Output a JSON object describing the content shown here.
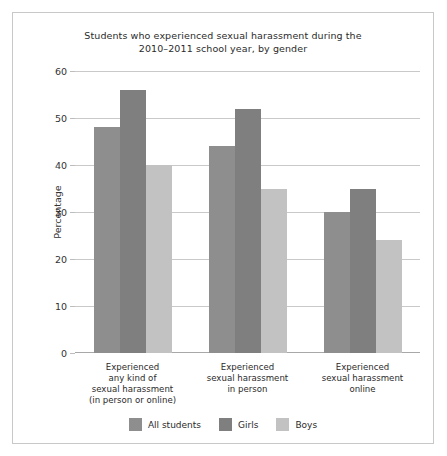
{
  "chart_data": {
    "type": "bar",
    "title": "Students who experienced sexual harassment during the\n2010–2011 school year, by gender",
    "title_line1": "Students who experienced sexual harassment during the",
    "title_line2": "2010–2011 school year, by gender",
    "xlabel": "",
    "ylabel": "Percentage",
    "ylim": [
      0,
      60
    ],
    "yticks": [
      0,
      10,
      20,
      30,
      40,
      50,
      60
    ],
    "ytick_labels": [
      "0",
      "10",
      "20",
      "30",
      "40",
      "50",
      "60"
    ],
    "grid": true,
    "legend_position": "bottom",
    "categories": [
      "Experienced\nany kind of\nsexual harassment\n(in person or online)",
      "Experienced\nsexual harassment\nin person",
      "Experienced\nsexual harassment\nonline"
    ],
    "series": [
      {
        "name": "All students",
        "color": "#8e8e8e",
        "values": [
          48,
          44,
          30
        ]
      },
      {
        "name": "Girls",
        "color": "#7f7f7f",
        "values": [
          56,
          52,
          35
        ]
      },
      {
        "name": "Boys",
        "color": "#c2c2c2",
        "values": [
          40,
          35,
          24
        ]
      }
    ]
  },
  "colors": {
    "frame": "#c8c8c8",
    "grid": "#c9c9c9",
    "axis": "#a8a8a8",
    "text": "#2b2b2b",
    "background": "#ffffff"
  }
}
